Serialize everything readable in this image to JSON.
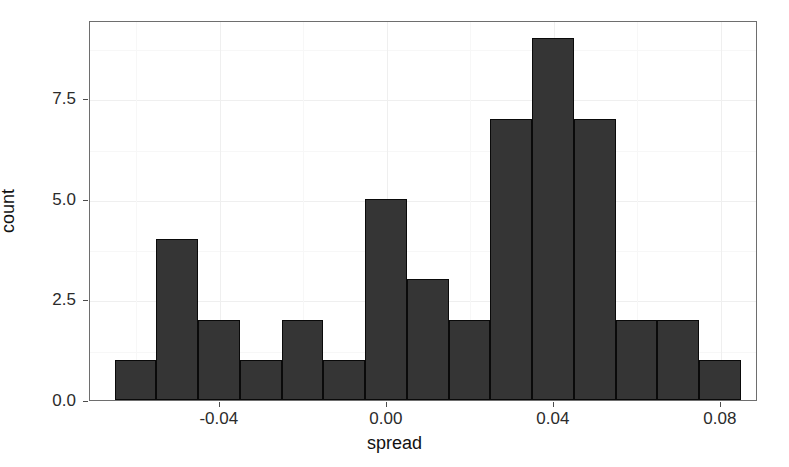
{
  "chart_data": {
    "type": "bar",
    "title": "",
    "subtitle": "",
    "xlabel": "spread",
    "ylabel": "count",
    "xlim": [
      -0.0711,
      0.0889
    ],
    "ylim": [
      0,
      9.45
    ],
    "grid": true,
    "legend": null,
    "legend_position": "none",
    "bin_width": 0.01,
    "n_bins": 15,
    "total_count": 43,
    "x_tick_labels": [
      "-0.04",
      "0.00",
      "0.04",
      "0.08"
    ],
    "x_tick_values": [
      -0.04,
      0.0,
      0.04,
      0.08
    ],
    "y_tick_labels": [
      "0.0",
      "2.5",
      "5.0",
      "7.5"
    ],
    "y_tick_values": [
      0.0,
      2.5,
      5.0,
      7.5
    ],
    "bin_starts": [
      -0.0652,
      -0.0552,
      -0.0452,
      -0.0352,
      -0.0252,
      -0.0152,
      -0.0052,
      0.0048,
      0.0148,
      0.0248,
      0.0348,
      0.0448,
      0.0548,
      0.0648,
      0.0748
    ],
    "bin_ends": [
      -0.0552,
      -0.0452,
      -0.0352,
      -0.0252,
      -0.0152,
      -0.0052,
      0.0048,
      0.0148,
      0.0248,
      0.0348,
      0.0448,
      0.0548,
      0.0648,
      0.0748,
      0.0848
    ],
    "bin_centers": [
      -0.0602,
      -0.0502,
      -0.0402,
      -0.0302,
      -0.0202,
      -0.0102,
      -0.0002,
      0.0098,
      0.0198,
      0.0298,
      0.0398,
      0.0498,
      0.0598,
      0.0698,
      0.0798
    ],
    "categories": [
      "-0.0602",
      "-0.0502",
      "-0.0402",
      "-0.0302",
      "-0.0202",
      "-0.0102",
      "-0.0002",
      "0.0098",
      "0.0198",
      "0.0298",
      "0.0398",
      "0.0498",
      "0.0598",
      "0.0698",
      "0.0798"
    ],
    "values": [
      1,
      4,
      2,
      1,
      2,
      1,
      5,
      3,
      2,
      7,
      9,
      7,
      2,
      2,
      1
    ],
    "bar_fill_color": "#353535",
    "bar_border_color": "#0a0a0a",
    "panel_background": "#ffffff",
    "gridline_color": "#efefef",
    "panel_border_color": "#6e6e6e"
  }
}
